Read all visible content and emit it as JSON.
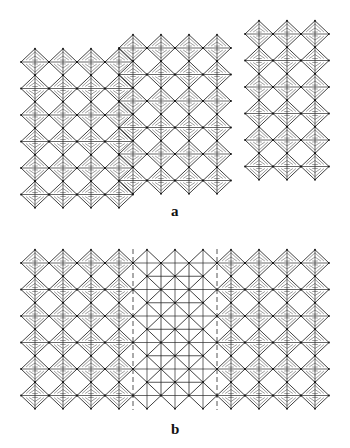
{
  "figure": {
    "colors": {
      "line": "#2a2a2a",
      "hatch": "#4a4a4a",
      "background": "#ffffff"
    },
    "cell": {
      "dx": 28,
      "dy": 26.5,
      "half_w": 14,
      "half_h": 13.25
    }
  },
  "panels": [
    {
      "label": "a",
      "label_pos": {
        "x": 171,
        "y": 203
      },
      "blocks": [
        {
          "name": "left-block",
          "x0": 35,
          "y0": 62,
          "cols": 4,
          "rows": 6,
          "style": "hatched"
        },
        {
          "name": "middle-block",
          "x0": 133,
          "y0": 48,
          "cols": 4,
          "rows": 6,
          "style": "hatched",
          "offset_half": true
        },
        {
          "name": "right-block",
          "x0": 259,
          "y0": 34,
          "cols": 3,
          "rows": 6,
          "style": "hatched"
        }
      ]
    },
    {
      "label": "b",
      "label_pos": {
        "x": 171,
        "y": 421
      },
      "blocks": [
        {
          "name": "left-block",
          "x0": 35,
          "y0": 263,
          "cols": 4,
          "rows": 6,
          "style": "hatched"
        },
        {
          "name": "middle-block",
          "x0": 147,
          "y0": 263,
          "cols": 3,
          "rows": 6,
          "style": "open"
        },
        {
          "name": "right-block",
          "x0": 231,
          "y0": 263,
          "cols": 4,
          "rows": 6,
          "style": "hatched"
        }
      ]
    }
  ]
}
